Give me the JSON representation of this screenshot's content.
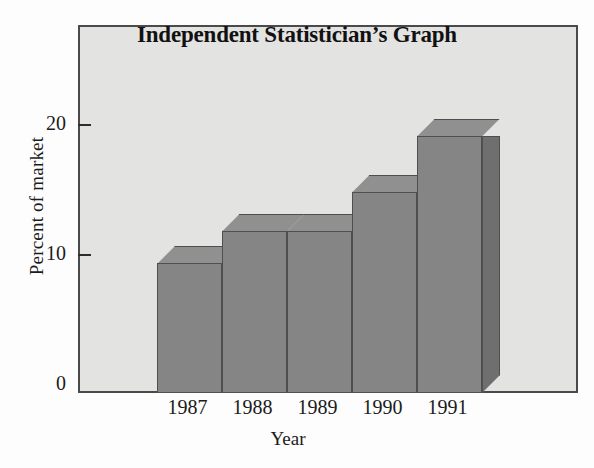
{
  "chart_data": {
    "type": "bar",
    "title": "Independent Statistician’s Graph",
    "xlabel": "Year",
    "ylabel": "Percent of market",
    "categories": [
      "1987",
      "1988",
      "1989",
      "1990",
      "1991"
    ],
    "values": [
      10,
      12.5,
      12.5,
      15.5,
      19.8
    ],
    "ytick_labels": [
      "0",
      "10",
      "20"
    ],
    "ytick_values": [
      0,
      10,
      20
    ],
    "ylim": [
      0,
      28
    ],
    "grid": false,
    "legend": false,
    "style": "3d-column",
    "colors": {
      "bar_front": "#858585",
      "bar_top": "#909090",
      "bar_side": "#6f6f6f",
      "bar_edge": "#4f4f4f",
      "plot_background": "#e3e3e1",
      "frame": "#4a4a4a",
      "text": "#1b1b1b"
    }
  }
}
